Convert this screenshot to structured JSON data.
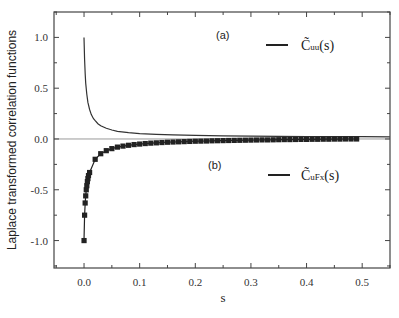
{
  "chart_data": {
    "type": "line",
    "title": "",
    "xlabel": "s",
    "ylabel": "Laplace transformed correlation functions",
    "xlim": [
      -0.054,
      0.55
    ],
    "ylim": [
      -1.27,
      1.25
    ],
    "xticks": [
      0.0,
      0.1,
      0.2,
      0.3,
      0.4,
      0.5
    ],
    "xtick_labels": [
      "0.0",
      "0.1",
      "0.2",
      "0.3",
      "0.4",
      "0.5"
    ],
    "yticks": [
      -1.0,
      -0.5,
      0.0,
      0.5,
      1.0
    ],
    "ytick_labels": [
      "-1.0",
      "-0.5",
      "0.0",
      "0.5",
      "1.0"
    ],
    "grid": false,
    "zero_line": true,
    "annotations": [
      {
        "text": "(a)",
        "x": 0.25,
        "y": 1.03
      },
      {
        "text": "(b)",
        "x": 0.235,
        "y": -0.26
      }
    ],
    "legend": [
      {
        "label_main": "C̃",
        "label_sub": "uu",
        "label_tail": "(s)",
        "style": "line",
        "x": 0.33,
        "y": 0.93
      },
      {
        "label_main": "C̃",
        "label_sub": "uFx",
        "label_tail": "(s)",
        "style": "line",
        "x": 0.33,
        "y": -0.38
      }
    ],
    "series": [
      {
        "name": "C̃uu(s)",
        "panel": "(a)",
        "style": "line",
        "color": "#333333",
        "x": [
          0.0,
          0.001,
          0.002,
          0.003,
          0.005,
          0.007,
          0.01,
          0.013,
          0.017,
          0.02,
          0.025,
          0.03,
          0.04,
          0.05,
          0.06,
          0.08,
          0.1,
          0.13,
          0.16,
          0.2,
          0.25,
          0.3,
          0.35,
          0.4,
          0.45,
          0.5,
          0.55
        ],
        "y": [
          1.0,
          0.78,
          0.64,
          0.55,
          0.44,
          0.36,
          0.29,
          0.24,
          0.2,
          0.18,
          0.15,
          0.13,
          0.105,
          0.088,
          0.076,
          0.062,
          0.053,
          0.045,
          0.04,
          0.035,
          0.031,
          0.028,
          0.026,
          0.024,
          0.023,
          0.022,
          0.021
        ]
      },
      {
        "name": "C̃uFx(s)",
        "panel": "(b)",
        "style": "line+square-markers",
        "color": "#222222",
        "x": [
          0.0,
          0.001,
          0.002,
          0.003,
          0.004,
          0.005,
          0.006,
          0.007,
          0.008,
          0.01,
          0.02,
          0.03,
          0.04,
          0.05,
          0.06,
          0.07,
          0.08,
          0.09,
          0.1,
          0.11,
          0.12,
          0.13,
          0.14,
          0.15,
          0.16,
          0.17,
          0.18,
          0.19,
          0.2,
          0.21,
          0.22,
          0.23,
          0.24,
          0.25,
          0.26,
          0.27,
          0.28,
          0.29,
          0.3,
          0.31,
          0.32,
          0.33,
          0.34,
          0.35,
          0.36,
          0.37,
          0.38,
          0.39,
          0.4,
          0.41,
          0.42,
          0.43,
          0.44,
          0.45,
          0.46,
          0.47,
          0.48,
          0.49
        ],
        "y": [
          -1.0,
          -0.75,
          -0.63,
          -0.56,
          -0.5,
          -0.46,
          -0.42,
          -0.39,
          -0.36,
          -0.33,
          -0.2,
          -0.145,
          -0.115,
          -0.095,
          -0.08,
          -0.07,
          -0.062,
          -0.055,
          -0.05,
          -0.045,
          -0.041,
          -0.038,
          -0.035,
          -0.032,
          -0.03,
          -0.028,
          -0.026,
          -0.024,
          -0.022,
          -0.021,
          -0.02,
          -0.018,
          -0.017,
          -0.016,
          -0.015,
          -0.014,
          -0.013,
          -0.012,
          -0.011,
          -0.01,
          -0.009,
          -0.009,
          -0.008,
          -0.007,
          -0.006,
          -0.006,
          -0.005,
          -0.004,
          -0.004,
          -0.003,
          -0.003,
          -0.002,
          -0.002,
          -0.001,
          -0.001,
          0.0,
          0.0,
          0.0
        ]
      }
    ]
  },
  "axes": {
    "xlabel": "s",
    "ylabel": "Laplace transformed correlation functions"
  },
  "annotations": {
    "a": "(a)",
    "b": "(b)"
  },
  "legend": {
    "uu": {
      "main": "C̃",
      "sub": "uu",
      "tail": "(s)"
    },
    "uFx": {
      "main": "C̃",
      "sub": "uFx",
      "tail": "(s)"
    }
  },
  "colors": {
    "axis": "#444444",
    "curve": "#333333",
    "markers": "#222222",
    "zero_line": "#999999"
  }
}
